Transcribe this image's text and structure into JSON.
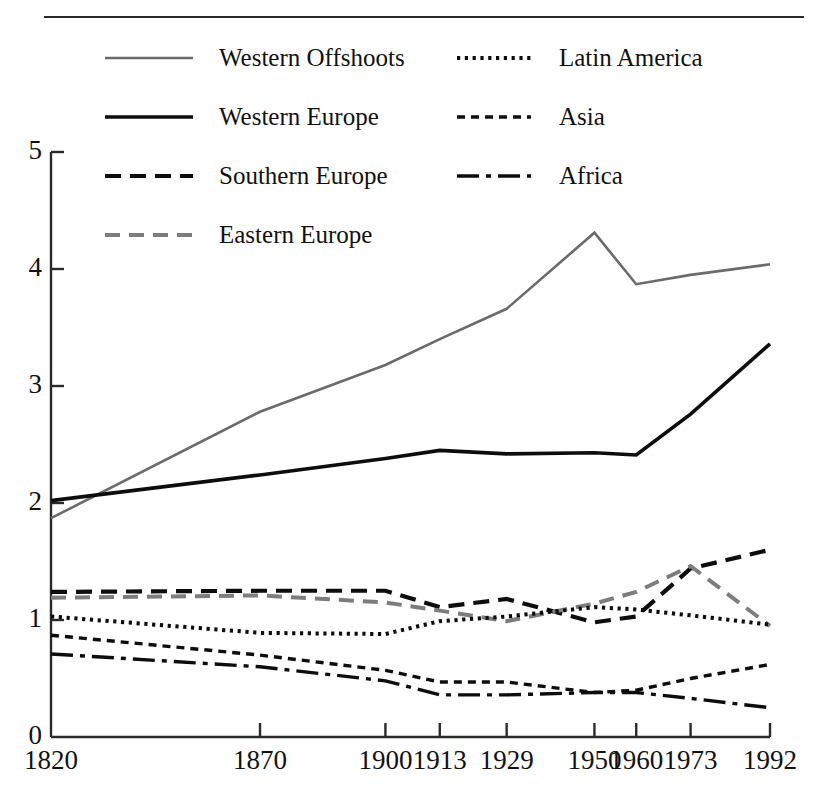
{
  "figure": {
    "has_top_rule": true
  },
  "chart_data": {
    "type": "line",
    "title": "",
    "subtitle": "",
    "xlabel": "",
    "ylabel": "",
    "x": [
      1820,
      1870,
      1900,
      1913,
      1929,
      1950,
      1960,
      1973,
      1992
    ],
    "xtick_labels": [
      "1820",
      "1870",
      "1900",
      "1913",
      "1929",
      "1950",
      "1960",
      "1973",
      "1992"
    ],
    "ytick_labels": [
      "0",
      "1",
      "2",
      "3",
      "4",
      "5"
    ],
    "yticks": [
      0,
      1,
      2,
      3,
      4,
      5
    ],
    "ylim": [
      0,
      5
    ],
    "xlim": [
      1820,
      1992
    ],
    "grid": false,
    "legend_position": "top",
    "axis_color": "#2a2a2a",
    "series": [
      {
        "name": "Western Offshoots",
        "values": [
          1.87,
          2.78,
          3.18,
          3.4,
          3.66,
          4.31,
          3.87,
          3.95,
          4.04
        ],
        "color": "#6b6b6b",
        "dash": "none",
        "width": 2.6
      },
      {
        "name": "Western Europe",
        "values": [
          2.02,
          2.24,
          2.38,
          2.45,
          2.42,
          2.43,
          2.41,
          2.76,
          3.36
        ],
        "color": "#0d0d0d",
        "dash": "none",
        "width": 3.6
      },
      {
        "name": "Southern Europe",
        "values": [
          1.24,
          1.25,
          1.25,
          1.11,
          1.18,
          0.98,
          1.03,
          1.44,
          1.6
        ],
        "color": "#0d0d0d",
        "dash": "16,9",
        "width": 4.2
      },
      {
        "name": "Eastern Europe",
        "values": [
          1.19,
          1.21,
          1.15,
          1.08,
          0.99,
          1.14,
          1.24,
          1.46,
          0.95
        ],
        "color": "#7d7d7d",
        "dash": "15,9",
        "width": 4.0
      },
      {
        "name": "Latin America",
        "values": [
          1.03,
          0.89,
          0.88,
          0.99,
          1.03,
          1.11,
          1.09,
          1.04,
          0.96
        ],
        "color": "#0d0d0d",
        "dash": "3.2,4.6",
        "width": 4.0
      },
      {
        "name": "Asia",
        "values": [
          0.87,
          0.7,
          0.57,
          0.47,
          0.47,
          0.38,
          0.4,
          0.5,
          0.62
        ],
        "color": "#0d0d0d",
        "dash": "8,6",
        "width": 3.4
      },
      {
        "name": "Africa",
        "values": [
          0.71,
          0.6,
          0.48,
          0.36,
          0.36,
          0.38,
          0.38,
          0.33,
          0.25
        ],
        "color": "#0d0d0d",
        "dash": "22,7,5,7",
        "width": 3.4
      }
    ]
  },
  "legend": {
    "columns": [
      {
        "entries": [
          {
            "label": "Western Offshoots",
            "series": "Western Offshoots"
          },
          {
            "label": "Western Europe",
            "series": "Western Europe"
          },
          {
            "label": "Southern Europe",
            "series": "Southern Europe"
          },
          {
            "label": "Eastern Europe",
            "series": "Eastern Europe"
          }
        ]
      },
      {
        "entries": [
          {
            "label": "Latin America",
            "series": "Latin America"
          },
          {
            "label": "Asia",
            "series": "Asia"
          },
          {
            "label": "Africa",
            "series": "Africa"
          }
        ]
      }
    ]
  }
}
